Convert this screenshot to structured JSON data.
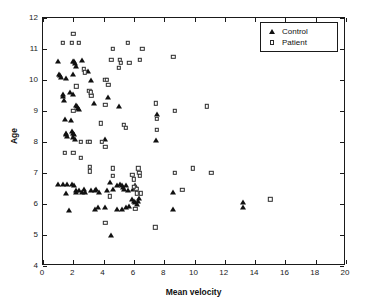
{
  "chart_data": {
    "type": "scatter",
    "title": "",
    "xlabel": "Mean velocity",
    "ylabel": "Age",
    "xlim": [
      0,
      20
    ],
    "ylim": [
      4,
      12
    ],
    "xticks": [
      0,
      2,
      4,
      6,
      8,
      10,
      12,
      14,
      16,
      18,
      20
    ],
    "yticks": [
      4,
      5,
      6,
      7,
      8,
      9,
      10,
      11,
      12
    ],
    "grid": false,
    "legend_position": "top-right",
    "series": [
      {
        "name": "Control",
        "marker": "filled-triangle",
        "color": "#111111",
        "points": [
          [
            1.0,
            10.6
          ],
          [
            1.05,
            10.2
          ],
          [
            1.15,
            10.15
          ],
          [
            1.2,
            10.1
          ],
          [
            1.3,
            9.55
          ],
          [
            1.35,
            9.5
          ],
          [
            1.4,
            9.35
          ],
          [
            1.45,
            8.75
          ],
          [
            1.5,
            8.3
          ],
          [
            1.55,
            8.25
          ],
          [
            1.6,
            8.2
          ],
          [
            1.5,
            10.05
          ],
          [
            1.95,
            10.6
          ],
          [
            2.05,
            10.6
          ],
          [
            2.1,
            10.55
          ],
          [
            2.15,
            10.45
          ],
          [
            2.0,
            10.2
          ],
          [
            2.6,
            10.65
          ],
          [
            1.8,
            9.6
          ],
          [
            2.0,
            9.55
          ],
          [
            2.25,
            9.15
          ],
          [
            2.3,
            9.1
          ],
          [
            2.35,
            9.05
          ],
          [
            2.2,
            9.2
          ],
          [
            1.85,
            8.7
          ],
          [
            1.9,
            8.35
          ],
          [
            2.0,
            8.3
          ],
          [
            2.05,
            8.25
          ],
          [
            2.0,
            8.15
          ],
          [
            2.1,
            8.1
          ],
          [
            3.0,
            10.3
          ],
          [
            3.15,
            10.0
          ],
          [
            3.2,
            9.6
          ],
          [
            3.35,
            9.25
          ],
          [
            4.3,
            9.45
          ],
          [
            5.0,
            9.15
          ],
          [
            4.1,
            8.1
          ],
          [
            7.5,
            8.9
          ],
          [
            7.45,
            8.05
          ],
          [
            1.0,
            6.65
          ],
          [
            1.3,
            6.65
          ],
          [
            1.6,
            6.65
          ],
          [
            1.55,
            6.35
          ],
          [
            1.9,
            6.65
          ],
          [
            2.05,
            6.6
          ],
          [
            2.15,
            6.45
          ],
          [
            2.2,
            6.4
          ],
          [
            2.35,
            6.45
          ],
          [
            2.6,
            6.4
          ],
          [
            2.7,
            6.5
          ],
          [
            2.8,
            6.4
          ],
          [
            3.2,
            6.45
          ],
          [
            3.4,
            6.45
          ],
          [
            3.5,
            6.5
          ],
          [
            3.7,
            6.4
          ],
          [
            4.2,
            6.45
          ],
          [
            4.4,
            6.7
          ],
          [
            4.6,
            6.5
          ],
          [
            4.9,
            6.6
          ],
          [
            5.1,
            6.65
          ],
          [
            5.2,
            6.6
          ],
          [
            5.3,
            6.55
          ],
          [
            5.35,
            6.5
          ],
          [
            5.5,
            6.6
          ],
          [
            5.6,
            6.45
          ],
          [
            5.9,
            6.15
          ],
          [
            6.0,
            6.1
          ],
          [
            6.1,
            6.05
          ],
          [
            6.2,
            6.0
          ],
          [
            6.3,
            6.1
          ],
          [
            6.35,
            6.2
          ],
          [
            5.5,
            5.9
          ],
          [
            5.7,
            5.95
          ],
          [
            5.2,
            5.85
          ],
          [
            4.9,
            5.85
          ],
          [
            4.1,
            5.9
          ],
          [
            3.6,
            5.9
          ],
          [
            3.4,
            5.85
          ],
          [
            1.7,
            5.8
          ],
          [
            4.5,
            5.0
          ],
          [
            8.6,
            6.4
          ],
          [
            8.6,
            5.85
          ],
          [
            13.2,
            6.05
          ],
          [
            13.2,
            5.9
          ],
          [
            6.1,
            6.6
          ],
          [
            5.95,
            6.5
          ]
        ]
      },
      {
        "name": "Patient",
        "marker": "open-square",
        "color": "#2b2b2b",
        "points": [
          [
            2.0,
            11.5
          ],
          [
            1.3,
            11.2
          ],
          [
            1.9,
            11.2
          ],
          [
            2.35,
            11.2
          ],
          [
            4.6,
            11.0
          ],
          [
            5.6,
            11.2
          ],
          [
            6.55,
            11.0
          ],
          [
            4.5,
            10.65
          ],
          [
            5.05,
            10.65
          ],
          [
            5.15,
            10.55
          ],
          [
            5.0,
            10.4
          ],
          [
            5.7,
            10.55
          ],
          [
            6.4,
            10.65
          ],
          [
            8.6,
            10.75
          ],
          [
            2.7,
            10.35
          ],
          [
            2.75,
            10.25
          ],
          [
            2.2,
            9.8
          ],
          [
            4.1,
            10.0
          ],
          [
            4.2,
            10.0
          ],
          [
            4.3,
            9.85
          ],
          [
            3.05,
            9.65
          ],
          [
            3.15,
            9.6
          ],
          [
            3.2,
            9.5
          ],
          [
            2.0,
            9.0
          ],
          [
            4.1,
            9.2
          ],
          [
            7.45,
            9.25
          ],
          [
            8.7,
            9.0
          ],
          [
            10.8,
            9.15
          ],
          [
            3.8,
            8.6
          ],
          [
            5.35,
            8.55
          ],
          [
            5.45,
            8.45
          ],
          [
            7.5,
            8.75
          ],
          [
            7.5,
            8.4
          ],
          [
            2.5,
            8.0
          ],
          [
            3.0,
            8.0
          ],
          [
            3.1,
            8.0
          ],
          [
            3.9,
            8.0
          ],
          [
            4.1,
            7.85
          ],
          [
            1.45,
            7.65
          ],
          [
            2.0,
            7.65
          ],
          [
            2.5,
            7.5
          ],
          [
            3.1,
            7.2
          ],
          [
            3.1,
            7.05
          ],
          [
            4.6,
            7.15
          ],
          [
            6.3,
            7.15
          ],
          [
            6.35,
            7.0
          ],
          [
            6.4,
            6.9
          ],
          [
            4.6,
            6.9
          ],
          [
            6.45,
            6.35
          ],
          [
            6.2,
            6.35
          ],
          [
            6.15,
            6.5
          ],
          [
            6.0,
            6.55
          ],
          [
            4.4,
            6.25
          ],
          [
            6.1,
            5.85
          ],
          [
            4.1,
            5.4
          ],
          [
            7.4,
            5.25
          ],
          [
            8.7,
            7.0
          ],
          [
            9.9,
            7.15
          ],
          [
            11.1,
            7.0
          ],
          [
            9.2,
            6.45
          ],
          [
            15.0,
            6.15
          ],
          [
            5.9,
            6.95
          ],
          [
            6.0,
            6.8
          ]
        ]
      }
    ]
  },
  "legend": {
    "entries": [
      {
        "label": "Control",
        "marker": "filled-triangle"
      },
      {
        "label": "Patient",
        "marker": "open-square"
      }
    ]
  },
  "axes": {
    "x_label": "Mean velocity",
    "y_label": "Age",
    "x_ticklabels": [
      "0",
      "2",
      "4",
      "6",
      "8",
      "10",
      "12",
      "14",
      "16",
      "18",
      "20"
    ],
    "y_ticklabels": [
      "4",
      "5",
      "6",
      "7",
      "8",
      "9",
      "10",
      "11",
      "12"
    ]
  },
  "colors": {
    "axis": "#1a1a1a",
    "control_marker": "#111111",
    "patient_marker": "#2b2b2b",
    "background": "#ffffff"
  }
}
